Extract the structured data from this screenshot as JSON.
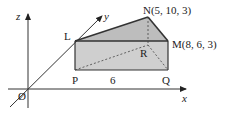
{
  "diagram": {
    "axes": {
      "x": "x",
      "y": "y",
      "z": "z",
      "origin": "Ø"
    },
    "points": {
      "L": "L",
      "P": "P",
      "Q": "Q",
      "R": "R",
      "N": "N(5, 10, 3)",
      "M": "M(8, 6, 3)"
    },
    "dimension_label": "6",
    "colors": {
      "face": "#cfcfcf",
      "line": "#333333"
    }
  }
}
